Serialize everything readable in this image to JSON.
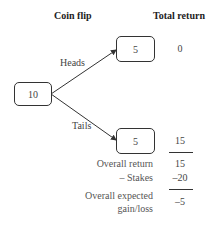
{
  "headers": {
    "coin_flip": "Coin flip",
    "total_return": "Total return"
  },
  "nodes": {
    "root": "10",
    "heads": "5",
    "tails": "5"
  },
  "edges": {
    "heads": "Heads",
    "tails": "Tails"
  },
  "returns": {
    "heads": "0",
    "tails": "15"
  },
  "summary": {
    "overall_return_label": "Overall return",
    "overall_return_value": "15",
    "stakes_label": "– Stakes",
    "stakes_value": "–20",
    "expected_label_line1": "Overall expected",
    "expected_label_line2": "gain/loss",
    "expected_value": "–5"
  }
}
